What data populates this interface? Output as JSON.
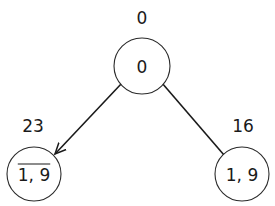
{
  "diagram": {
    "type": "tree",
    "nodes": [
      {
        "id": "root",
        "label": "0",
        "value": "0",
        "overline": false,
        "cx": 142,
        "cy": 66,
        "r": 28,
        "value_x": 142,
        "value_y": 18
      },
      {
        "id": "left",
        "label": "1, 9",
        "value": "23",
        "overline": true,
        "cx": 34,
        "cy": 174,
        "r": 27,
        "value_x": 33,
        "value_y": 126
      },
      {
        "id": "right",
        "label": "1, 9",
        "value": "16",
        "overline": false,
        "cx": 242,
        "cy": 174,
        "r": 27,
        "value_x": 243,
        "value_y": 126
      }
    ],
    "edges": [
      {
        "from": "root",
        "to": "left",
        "arrow": true,
        "x1": 122,
        "y1": 83,
        "x2": 55,
        "y2": 154
      },
      {
        "from": "root",
        "to": "right",
        "arrow": false,
        "x1": 162,
        "y1": 83,
        "x2": 224,
        "y2": 155
      }
    ],
    "colors": {
      "stroke": "#1a1a1a",
      "background": "#ffffff"
    }
  }
}
